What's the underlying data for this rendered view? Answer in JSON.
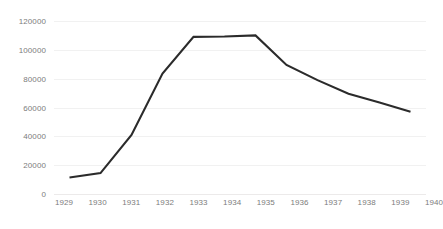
{
  "chart_data": {
    "type": "line",
    "title": "",
    "subtitle": "",
    "xlabel": "",
    "ylabel": "",
    "categories": [
      "1929",
      "1930",
      "1931",
      "1932",
      "1933",
      "1934",
      "1935",
      "1936",
      "1937",
      "1938",
      "1939",
      "1940"
    ],
    "x": [
      1929,
      1930,
      1931,
      1932,
      1933,
      1934,
      1935,
      1936,
      1937,
      1938,
      1939,
      1940
    ],
    "values": [
      11500,
      14500,
      41000,
      83500,
      109000,
      109200,
      110000,
      89500,
      79000,
      69500,
      63500,
      57000
    ],
    "series": [
      {
        "name": "",
        "color": "#2b2b2b",
        "values": [
          11500,
          14500,
          41000,
          83500,
          109000,
          109200,
          110000,
          89500,
          79000,
          69500,
          63500,
          57000
        ]
      }
    ],
    "ylim": [
      0,
      120000
    ],
    "yticks": [
      0,
      20000,
      40000,
      60000,
      80000,
      100000,
      120000
    ],
    "ytick_labels": [
      "0",
      "20000",
      "40000",
      "60000",
      "80000",
      "100000",
      "120000"
    ],
    "xtick_labels": [
      "1929",
      "1930",
      "1931",
      "1932",
      "1933",
      "1934",
      "1935",
      "1936",
      "1937",
      "1938",
      "1939",
      "1940"
    ],
    "grid": true,
    "grid_axis": "y",
    "legend": false,
    "legend_position": "none",
    "annotations": [],
    "colors": {
      "line": "#2b2b2b",
      "grid": "#f1f1f1",
      "tick_text": "#7c7c7c",
      "background": "#ffffff"
    }
  }
}
